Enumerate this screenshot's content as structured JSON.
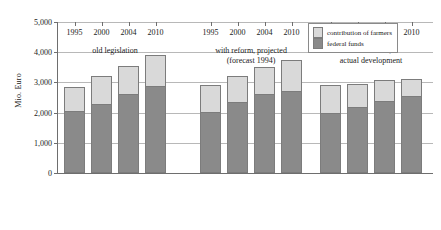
{
  "chart_data": {
    "type": "bar",
    "stacked": true,
    "title": "",
    "xlabel": "",
    "ylabel": "Mio. Euro",
    "ylim": [
      0,
      5000
    ],
    "ytick_labels": [
      "0",
      "1,000",
      "2,000",
      "3,000",
      "4,000",
      "5,000"
    ],
    "ytick_values": [
      0,
      1000,
      2000,
      3000,
      4000,
      5000
    ],
    "grid": true,
    "legend_position": "top-right",
    "series": [
      {
        "name": "federal funds",
        "color": "#8a8a8a",
        "values": [
          2050,
          2300,
          2600,
          2870,
          2030,
          2350,
          2630,
          2700,
          2000,
          2200,
          2400,
          2550
        ]
      },
      {
        "name": "contribution of farmers",
        "color": "#d9d9d9",
        "values": [
          800,
          900,
          950,
          1030,
          870,
          850,
          870,
          1050,
          900,
          750,
          670,
          570
        ]
      }
    ],
    "totals": [
      2850,
      3200,
      3550,
      3900,
      2900,
      3200,
      3500,
      3750,
      2900,
      2950,
      3070,
      3120
    ],
    "categories": [
      "1995",
      "2000",
      "2004",
      "2010",
      "1995",
      "2000",
      "2004",
      "2010",
      "1995",
      "2000",
      "2004",
      "2010"
    ],
    "groups": [
      {
        "lines": [
          "old legislation"
        ],
        "indices": [
          0,
          1,
          2,
          3
        ]
      },
      {
        "lines": [
          "with reform, projected",
          "(forecast 1994)"
        ],
        "indices": [
          4,
          5,
          6,
          7
        ]
      },
      {
        "lines": [
          "with reform,",
          "actual development"
        ],
        "indices": [
          8,
          9,
          10,
          11
        ]
      }
    ]
  },
  "legend": {
    "items": [
      {
        "label": "contribution of farmers",
        "swatch": "farmers-swatch"
      },
      {
        "label": "federal funds",
        "swatch": "federal-swatch"
      }
    ]
  },
  "axis": {
    "y_title": "Mio. Euro"
  }
}
